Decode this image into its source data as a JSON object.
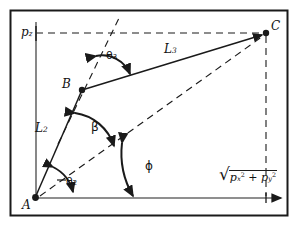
{
  "figure": {
    "kind": "geometry-diagram",
    "frame_color": "#1a1a1a",
    "line_color": "#1a1a1a",
    "background": "#ffffff"
  },
  "points": [
    {
      "id": "A",
      "label": "A",
      "x": 35,
      "y": 198
    },
    {
      "id": "B",
      "label": "B",
      "x": 82,
      "y": 90
    },
    {
      "id": "C",
      "label": "C",
      "x": 266,
      "y": 33
    }
  ],
  "labels": {
    "p2": {
      "text": "p",
      "sub": "z"
    },
    "L2": {
      "text": "L",
      "sub": "2"
    },
    "L3": {
      "text": "L",
      "sub": "3"
    },
    "A": "A",
    "B": "B",
    "C": "C"
  },
  "angles": [
    {
      "id": "theta3",
      "glyph": "θ",
      "sub": "3",
      "x": 108,
      "y": 57,
      "at": "B"
    },
    {
      "id": "beta",
      "glyph": "β",
      "sub": "",
      "x": 92,
      "y": 128,
      "at": "A"
    },
    {
      "id": "phi",
      "glyph": "ϕ",
      "sub": "",
      "x": 147,
      "y": 167,
      "at": "A"
    },
    {
      "id": "theta2",
      "glyph": "θ",
      "sub": "2",
      "x": 66,
      "y": 183,
      "at": "A"
    }
  ],
  "expression": {
    "id": "magnitude",
    "radical": "√",
    "term1_base": "p",
    "term1_sub": "x",
    "term1_sup": "2",
    "operator": "+",
    "term2_base": "p",
    "term2_sub": "y",
    "term2_sup": "2",
    "x": 224,
    "y": 174
  }
}
